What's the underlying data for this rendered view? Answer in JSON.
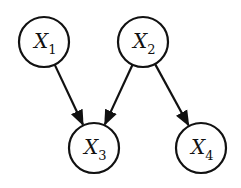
{
  "diagram": {
    "type": "bayesian-network",
    "nodes": [
      {
        "id": "X1",
        "label": "X",
        "subscript": "1",
        "cx": 44,
        "cy": 42
      },
      {
        "id": "X2",
        "label": "X",
        "subscript": "2",
        "cx": 143,
        "cy": 42
      },
      {
        "id": "X3",
        "label": "X",
        "subscript": "3",
        "cx": 94,
        "cy": 148
      },
      {
        "id": "X4",
        "label": "X",
        "subscript": "4",
        "cx": 201,
        "cy": 148
      }
    ],
    "edges": [
      {
        "from": "X1",
        "to": "X3"
      },
      {
        "from": "X2",
        "to": "X3"
      },
      {
        "from": "X2",
        "to": "X4"
      }
    ],
    "node_radius": 25,
    "colors": {
      "stroke": "#111111",
      "fill": "#ffffff",
      "background": "#ffffff"
    }
  }
}
